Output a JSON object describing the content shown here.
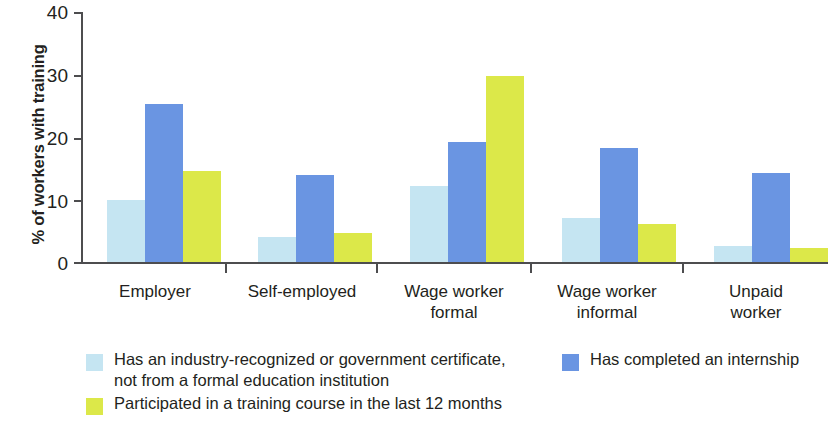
{
  "chart_data": {
    "type": "bar",
    "title": "",
    "subtitle": "",
    "xlabel": "",
    "ylabel": "% of workers with training",
    "ylim": [
      0,
      40
    ],
    "yticks": [
      0,
      10,
      20,
      30,
      40
    ],
    "grid": false,
    "legend_position": "bottom",
    "categories": [
      "Employer",
      "Self-employed",
      "Wage worker\nformal",
      "Wage worker\ninformal",
      "Unpaid\nworker"
    ],
    "series": [
      {
        "name": "Has an industry-recognized or government certificate, not from a formal education institution",
        "color": "#c5e5f2",
        "values": [
          10.0,
          4.0,
          12.2,
          7.0,
          2.5
        ]
      },
      {
        "name": "Has completed an internship",
        "color": "#6a95e2",
        "values": [
          25.3,
          14.0,
          19.2,
          18.2,
          14.2
        ]
      },
      {
        "name": "Participated in a training course in the last 12 months",
        "color": "#dce849",
        "values": [
          14.5,
          4.6,
          29.8,
          6.1,
          2.2
        ]
      }
    ]
  },
  "axis": {
    "y_title": "% of workers with training",
    "y_tick_labels": [
      "40",
      "30",
      "20",
      "10",
      "0"
    ]
  },
  "x_labels": [
    {
      "line1": "Employer",
      "line2": ""
    },
    {
      "line1": "Self-employed",
      "line2": ""
    },
    {
      "line1": "Wage worker",
      "line2": "formal"
    },
    {
      "line1": "Wage worker",
      "line2": "informal"
    },
    {
      "line1": "Unpaid",
      "line2": "worker"
    }
  ],
  "legend": {
    "items": [
      {
        "label": "Has an industry-recognized or government certificate,\nnot from a formal education institution",
        "color": "#c5e5f2"
      },
      {
        "label": "Has completed an internship",
        "color": "#6a95e2"
      },
      {
        "label": "Participated in a training course in the last 12 months",
        "color": "#dce849"
      }
    ]
  },
  "colors": {
    "series1": "#c5e5f2",
    "series2": "#6a95e2",
    "series3": "#dce849",
    "axis": "#4d4d4f",
    "text": "#231f20",
    "background": "#ffffff"
  }
}
